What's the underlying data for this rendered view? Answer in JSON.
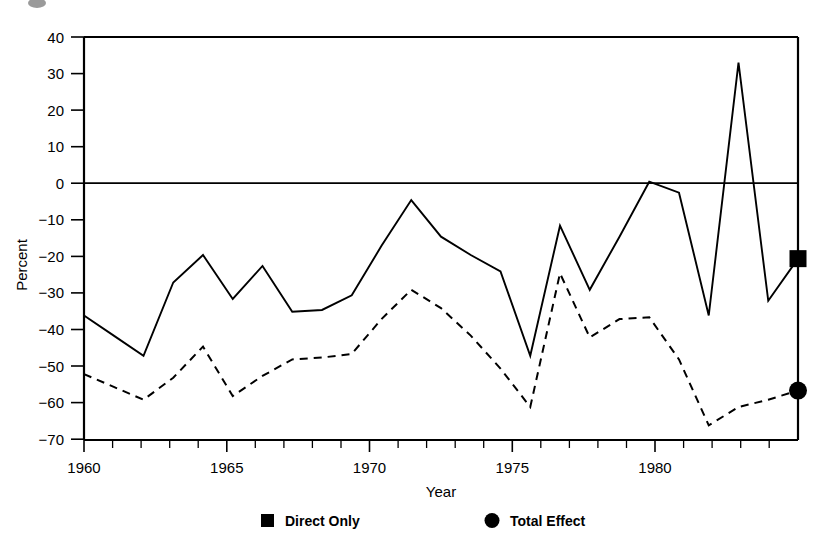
{
  "chart_data": {
    "type": "line",
    "title": "",
    "xlabel": "Year",
    "ylabel": "Percent",
    "xlim": [
      1960,
      1984
    ],
    "ylim": [
      -70,
      40
    ],
    "grid": false,
    "zero_line": true,
    "legend_position": "bottom",
    "x_major_ticks": [
      1960,
      1965,
      1970,
      1975,
      1980
    ],
    "x_major_tick_labels": [
      "1960",
      "1965",
      "1970",
      "1975",
      "1980"
    ],
    "x_minor_tick_step": 1,
    "y_ticks": [
      40,
      30,
      20,
      10,
      0,
      -10,
      -20,
      -30,
      -40,
      -50,
      -60,
      -70
    ],
    "y_tick_labels": [
      "40",
      "30",
      "20",
      "10",
      "0",
      "−10",
      "−20",
      "−30",
      "−40",
      "−50",
      "−60",
      "−70"
    ],
    "x": [
      1960,
      1961,
      1962,
      1963,
      1964,
      1965,
      1966,
      1967,
      1968,
      1969,
      1970,
      1971,
      1972,
      1973,
      1974,
      1975,
      1976,
      1977,
      1978,
      1979,
      1980,
      1981,
      1982,
      1983,
      1984
    ],
    "series": [
      {
        "name": "Direct Only",
        "marker": "square",
        "linestyle": "solid",
        "color": "#000000",
        "values": [
          -36.0,
          -41.5,
          -47.0,
          -27.0,
          -19.5,
          -31.5,
          -22.5,
          -35.0,
          -34.5,
          -30.5,
          -17.0,
          -4.5,
          -14.5,
          -19.5,
          -24.0,
          -47.0,
          -11.5,
          -29.0,
          -14.5,
          0.5,
          -2.5,
          -36.0,
          33.0,
          -32.0,
          -20.5
        ]
      },
      {
        "name": "Total Effect",
        "marker": "circle",
        "linestyle": "dashed",
        "color": "#000000",
        "values": [
          -52.0,
          -55.5,
          -59.0,
          -53.0,
          -44.5,
          -58.0,
          -52.5,
          -48.0,
          -47.5,
          -46.5,
          -37.0,
          -29.0,
          -34.0,
          -41.5,
          -50.5,
          -61.0,
          -24.5,
          -42.0,
          -37.0,
          -36.5,
          -48.0,
          -66.0,
          -61.0,
          -59.0,
          -56.5
        ]
      }
    ],
    "end_markers": [
      {
        "series": "Direct Only",
        "shape": "square",
        "x": 1984,
        "y": -20.5
      },
      {
        "series": "Total Effect",
        "shape": "circle",
        "x": 1984,
        "y": -56.5
      }
    ]
  },
  "legend": {
    "items": [
      {
        "marker": "square",
        "label": "Direct Only"
      },
      {
        "marker": "circle",
        "label": "Total Effect"
      }
    ]
  }
}
